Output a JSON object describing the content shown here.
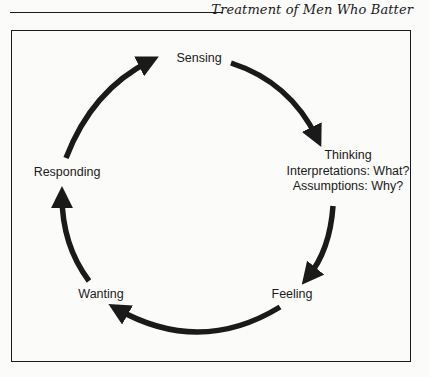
{
  "header": {
    "running_title": "Treatment of Men Who Batter"
  },
  "diagram": {
    "type": "cycle",
    "nodes": [
      {
        "id": "sensing",
        "label": "Sensing"
      },
      {
        "id": "thinking",
        "label": "Thinking",
        "sublabels": [
          "Interpretations: What?",
          "Assumptions: Why?"
        ]
      },
      {
        "id": "feeling",
        "label": "Feeling"
      },
      {
        "id": "wanting",
        "label": "Wanting"
      },
      {
        "id": "responding",
        "label": "Responding"
      }
    ],
    "edges": [
      {
        "from": "sensing",
        "to": "thinking"
      },
      {
        "from": "thinking",
        "to": "feeling"
      },
      {
        "from": "feeling",
        "to": "wanting"
      },
      {
        "from": "wanting",
        "to": "responding"
      },
      {
        "from": "responding",
        "to": "sensing"
      }
    ],
    "colors": {
      "ink": "#1a1a1a",
      "paper": "#fbfbf9"
    }
  }
}
